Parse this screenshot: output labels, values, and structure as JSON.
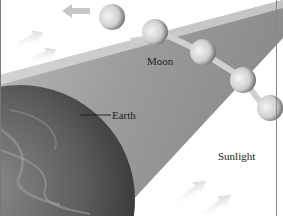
{
  "diagram": {
    "labels": {
      "moon": "Moon",
      "earth": "Earth",
      "sunlight": "Sunlight"
    },
    "elements": {
      "earth": "earth-globe",
      "shadow": "earth-shadow-cone",
      "moon_positions": 5,
      "sunlight_arrows": 6
    },
    "colors": {
      "shadow": "#9a9a9a",
      "earth": "#5a5a5a",
      "moon": "#cfcfcf",
      "arrow": "#d6d6d6",
      "text": "#222222"
    }
  }
}
